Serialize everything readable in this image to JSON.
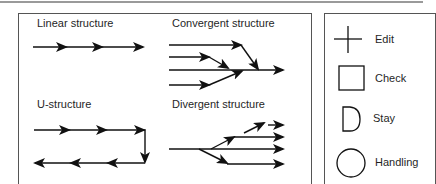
{
  "diagram": {
    "panels": [
      {
        "id": "linear",
        "title": "Linear structure"
      },
      {
        "id": "convergent",
        "title": "Convergent structure"
      },
      {
        "id": "u",
        "title": "U-structure"
      },
      {
        "id": "divergent",
        "title": "Divergent structure"
      }
    ],
    "legend": [
      {
        "symbol": "plus-icon",
        "label": "Edit"
      },
      {
        "symbol": "square-icon",
        "label": "Check"
      },
      {
        "symbol": "d-shape-icon",
        "label": "Stay"
      },
      {
        "symbol": "circle-icon",
        "label": "Handling"
      }
    ],
    "colors": {
      "stroke": "#111111",
      "border": "#555555",
      "topline": "#9a9a9a"
    }
  }
}
